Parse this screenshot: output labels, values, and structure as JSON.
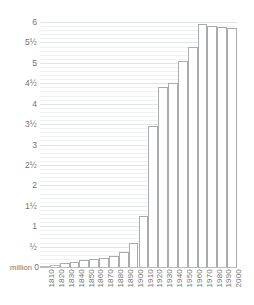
{
  "chart_data": {
    "type": "bar",
    "title": "",
    "subtitle": "",
    "xlabel": "",
    "ylabel": "",
    "unit_label": "million",
    "categories": [
      "1810",
      "1820",
      "1830",
      "1840",
      "1850",
      "1860",
      "1870",
      "1880",
      "1890",
      "1900",
      "1910",
      "1920",
      "1930",
      "1940",
      "1950",
      "1960",
      "1970",
      "1980",
      "1990",
      "2000"
    ],
    "values": [
      0.015,
      0.06,
      0.1,
      0.13,
      0.17,
      0.2,
      0.23,
      0.28,
      0.37,
      0.6,
      1.25,
      3.45,
      4.4,
      4.5,
      5.05,
      5.4,
      5.95,
      5.9,
      5.87,
      5.85
    ],
    "ylim": [
      0,
      6.1
    ],
    "ytick_values": [
      0,
      0.5,
      1,
      1.5,
      2,
      2.5,
      3,
      3.5,
      4,
      4.5,
      5,
      5.5,
      6
    ],
    "ytick_labels": [
      "0",
      "½",
      "1",
      "1½",
      "2",
      "2½",
      "3",
      "3½",
      "4",
      "4½",
      "5",
      "5½",
      "6"
    ],
    "minor_gridline_step": 0.1,
    "grid": true,
    "legend": null,
    "legend_position": "none",
    "bar_fill_color": "#ffffff",
    "bar_border_color": "#a9abae",
    "gridline_color": "#f0f1f3",
    "major_gridline_color": "#e2e4e8",
    "axis_color": "#b9bbbe",
    "text_color": "#737373"
  }
}
